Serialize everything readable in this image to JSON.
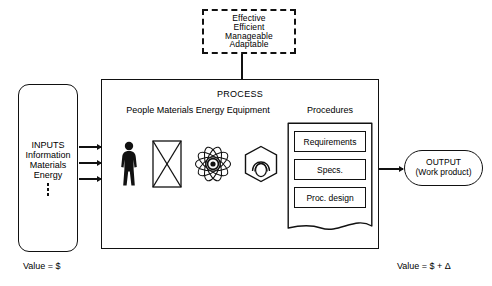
{
  "diagram": {
    "goals_box": {
      "name": "quality-attributes",
      "items": [
        "Effective",
        "Efficient",
        "Manageable",
        "Adaptable"
      ]
    },
    "inputs_box": {
      "heading": "INPUTS",
      "items": [
        "Information",
        "Materials",
        "Energy"
      ],
      "ellipsis": "⋮",
      "arrow_count": 3
    },
    "process_box": {
      "title": "PROCESS",
      "resources_label": "People  Materials  Energy  Equipment",
      "procedures_label": "Procedures",
      "resource_icons": [
        {
          "icon": "person-icon",
          "label": "People"
        },
        {
          "icon": "material-block-icon",
          "label": "Materials"
        },
        {
          "icon": "atom-icon",
          "label": "Energy"
        },
        {
          "icon": "hex-nut-icon",
          "label": "Equipment"
        }
      ],
      "procedures": [
        "Requirements",
        "Specs.",
        "Proc. design"
      ]
    },
    "output_box": {
      "heading": "OUTPUT",
      "subheading": "(Work product)"
    },
    "captions": {
      "input_value": "Value  =  $",
      "output_value": "Value  =  $  +  Δ"
    },
    "colors": {
      "ink": "#111111",
      "background": "#ffffff"
    }
  }
}
